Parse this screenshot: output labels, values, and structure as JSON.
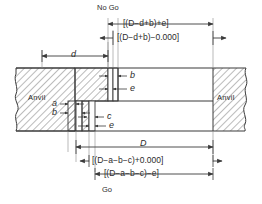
{
  "diagram": {
    "title_top": "No Go",
    "title_bottom": "Go",
    "anvil_left_label": "Anvil",
    "anvil_right_label": "Anvil",
    "dimensions": {
      "no_go_upper": "[(D−d+b)+e]",
      "no_go_lower": "[(D−d+b)−0.000]",
      "small_d": "d",
      "big_D": "D",
      "go_upper": "[(D−a−b−c)+0.000]",
      "go_lower": "[(D−a−b−c)−e]"
    },
    "callouts": {
      "b_top": "b",
      "e_top": "e",
      "a_left": "a",
      "b_left": "b",
      "c_bottom": "c",
      "e_bottom": "e"
    },
    "colors": {
      "line": "#3a3a3a",
      "hatch": "#555555",
      "text": "#2b2b2b",
      "background": "#ffffff"
    }
  }
}
